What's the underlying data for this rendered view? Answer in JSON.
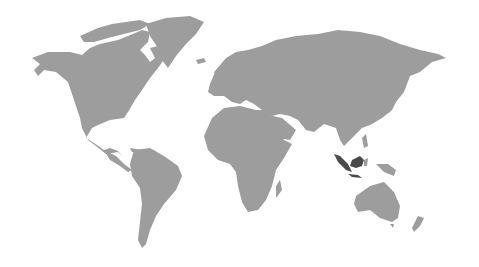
{
  "map": {
    "type": "world-choropleth",
    "colors": {
      "land": "#9d9d9d",
      "highlight": "#4a4a4a",
      "background": "#ffffff"
    },
    "highlighted_regions": [
      "Indonesia"
    ]
  }
}
